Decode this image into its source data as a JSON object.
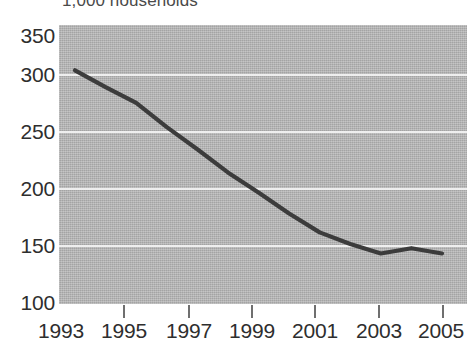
{
  "caption": {
    "unit_note": "1,000 households"
  },
  "chart_data": {
    "type": "line",
    "title": "",
    "subtitle": "",
    "xlabel": "",
    "ylabel": "1,000 households",
    "x": [
      1993,
      1994,
      1995,
      1996,
      1997,
      1998,
      1999,
      2000,
      2001,
      2002,
      2003,
      2004,
      2005
    ],
    "values": [
      322,
      306,
      291,
      268,
      247,
      225,
      206,
      186,
      168,
      157,
      148,
      153,
      148
    ],
    "series": [
      {
        "name": "households",
        "values": [
          322,
          306,
          291,
          268,
          247,
          225,
          206,
          186,
          168,
          157,
          148,
          153,
          148
        ]
      }
    ],
    "xlim": [
      1993,
      2005
    ],
    "ylim": [
      100,
      365
    ],
    "ytick_labels": [
      "350",
      "300",
      "250",
      "200",
      "150",
      "100"
    ],
    "ytick_values": [
      350,
      300,
      250,
      200,
      150,
      100
    ],
    "xtick_labels": [
      "1993",
      "1995",
      "1997",
      "1999",
      "2001",
      "2003",
      "2005"
    ],
    "xtick_values": [
      1993,
      1995,
      1997,
      1999,
      2001,
      2003,
      2005
    ],
    "grid": true,
    "legend": "none",
    "colors": {
      "plot_background": "#b4b4b4",
      "gridline": "#efefef",
      "line": "#3c3c3c",
      "text": "#2e2e2e"
    }
  }
}
